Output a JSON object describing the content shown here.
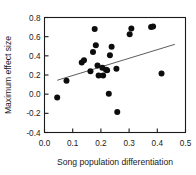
{
  "chart_data": {
    "type": "scatter",
    "title": "",
    "xlabel": "Song population differentiation",
    "ylabel": "Maximum effect size",
    "xlim": [
      0.0,
      0.5
    ],
    "ylim": [
      -0.4,
      0.8
    ],
    "xticks": [
      0.0,
      0.1,
      0.2,
      0.3,
      0.4,
      0.5
    ],
    "xticklabels": [
      "0.0",
      "0.1",
      "0.2",
      "0.3",
      "0.4",
      "0.5"
    ],
    "yticks": [
      -0.4,
      -0.2,
      0.0,
      0.2,
      0.4,
      0.6,
      0.8
    ],
    "yticklabels": [
      "-0.4",
      "-0.2",
      "0.0",
      "0.2",
      "0.4",
      "0.6",
      "0.8"
    ],
    "grid": false,
    "legend": null,
    "marker": "filled-circle",
    "marker_color": "#0d0d0d",
    "points": [
      {
        "x": 0.045,
        "y": -0.035
      },
      {
        "x": 0.078,
        "y": 0.14
      },
      {
        "x": 0.132,
        "y": 0.33
      },
      {
        "x": 0.14,
        "y": 0.355
      },
      {
        "x": 0.163,
        "y": 0.24
      },
      {
        "x": 0.172,
        "y": 0.44
      },
      {
        "x": 0.178,
        "y": 0.68
      },
      {
        "x": 0.182,
        "y": 0.51
      },
      {
        "x": 0.188,
        "y": 0.3
      },
      {
        "x": 0.192,
        "y": 0.195
      },
      {
        "x": 0.205,
        "y": 0.275
      },
      {
        "x": 0.208,
        "y": 0.195
      },
      {
        "x": 0.218,
        "y": 0.255
      },
      {
        "x": 0.222,
        "y": 0.25
      },
      {
        "x": 0.228,
        "y": 0.005
      },
      {
        "x": 0.232,
        "y": 0.405
      },
      {
        "x": 0.238,
        "y": 0.495
      },
      {
        "x": 0.255,
        "y": 0.265
      },
      {
        "x": 0.258,
        "y": -0.185
      },
      {
        "x": 0.302,
        "y": 0.625
      },
      {
        "x": 0.308,
        "y": 0.685
      },
      {
        "x": 0.378,
        "y": 0.7
      },
      {
        "x": 0.385,
        "y": 0.705
      },
      {
        "x": 0.415,
        "y": 0.215
      }
    ],
    "trendline": {
      "type": "linear-fit",
      "x_start": 0.045,
      "y_start": 0.145,
      "x_end": 0.462,
      "y_end": 0.52,
      "color": "#4a4a4a"
    }
  }
}
